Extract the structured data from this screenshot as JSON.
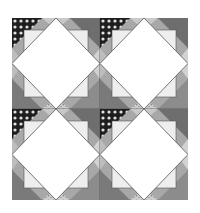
{
  "image": {
    "description": "Quilt pattern: 2x2 grid of square-in-a-square blocks with grayscale print fabrics",
    "grid": {
      "rows": 2,
      "cols": 2
    },
    "colors": {
      "background": "#ffffff",
      "center": "#ffffff",
      "outline": "#555555",
      "dark_gray": "#6e6e6e",
      "mid_gray": "#9a9a9a",
      "light_gray": "#c8c8c8",
      "black_print": "#1e1e1e"
    }
  }
}
